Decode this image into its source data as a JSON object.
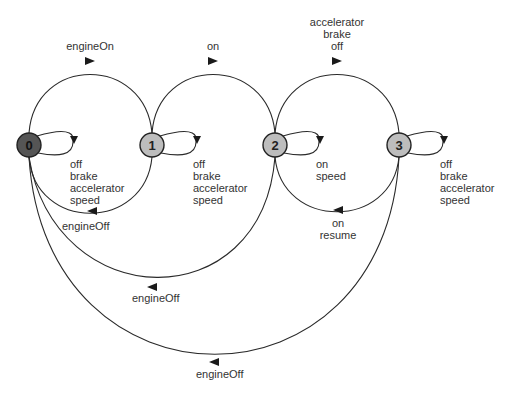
{
  "diagram": {
    "type": "state-machine",
    "colors": {
      "initial_state_fill": "#555555",
      "state_fill": "#bdbdbd",
      "stroke": "#222222",
      "text": "#333333"
    },
    "states": [
      {
        "id": "0",
        "label": "0",
        "initial": true
      },
      {
        "id": "1",
        "label": "1",
        "initial": false
      },
      {
        "id": "2",
        "label": "2",
        "initial": false
      },
      {
        "id": "3",
        "label": "3",
        "initial": false
      }
    ],
    "transitions": [
      {
        "from": "0",
        "to": "1",
        "labels": [
          "engineOn"
        ]
      },
      {
        "from": "1",
        "to": "0",
        "labels": [
          "engineOff"
        ]
      },
      {
        "from": "1",
        "to": "2",
        "labels": [
          "on"
        ]
      },
      {
        "from": "2",
        "to": "3",
        "labels": [
          "accelerator",
          "brake",
          "off"
        ]
      },
      {
        "from": "3",
        "to": "2",
        "labels": [
          "on",
          "resume"
        ]
      },
      {
        "from": "2",
        "to": "0",
        "labels": [
          "engineOff"
        ]
      },
      {
        "from": "3",
        "to": "0",
        "labels": [
          "engineOff"
        ]
      },
      {
        "from": "0",
        "to": "0",
        "labels": [
          "off",
          "brake",
          "accelerator",
          "speed"
        ]
      },
      {
        "from": "1",
        "to": "1",
        "labels": [
          "off",
          "brake",
          "accelerator",
          "speed"
        ]
      },
      {
        "from": "2",
        "to": "2",
        "labels": [
          "on",
          "speed"
        ]
      },
      {
        "from": "3",
        "to": "3",
        "labels": [
          "off",
          "brake",
          "accelerator",
          "speed"
        ]
      }
    ]
  }
}
